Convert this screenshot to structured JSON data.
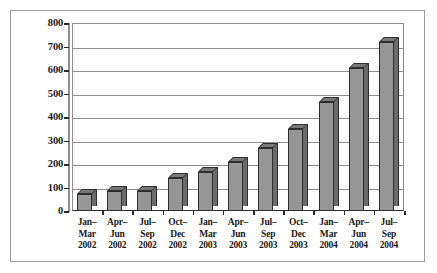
{
  "chart_data": {
    "type": "bar",
    "title": "",
    "subtitle": "",
    "xlabel": "",
    "ylabel": "",
    "ylim": [
      0,
      800
    ],
    "ytick_step": 100,
    "yticks": [
      800,
      700,
      600,
      500,
      400,
      300,
      200,
      100,
      0
    ],
    "ytick_labels": [
      "800",
      "700",
      "600",
      "500",
      "400",
      "300",
      "200",
      "100",
      "0"
    ],
    "grid": true,
    "grid_axis": "y",
    "legend": false,
    "legend_position": "none",
    "style": "3d-bar",
    "bar_color": "#969696",
    "bar_side_color": "#6b6b6b",
    "bar_top_color": "#787878",
    "bar_edge_color": "#2e2e2e",
    "grid_color": "#8d8d8d",
    "axis_color": "#2b2b2b",
    "frame_color": "#9a9a9a",
    "background_color": "#ffffff",
    "categories": [
      "Jan–Mar 2002",
      "Apr–Jun 2002",
      "Jul–Sep 2002",
      "Oct–Dec 2002",
      "Jan–Mar 2003",
      "Apr–Jun 2003",
      "Jul–Sep 2003",
      "Oct–Dec 2003",
      "Jan–Mar 2004",
      "Apr–Jun 2004",
      "Jul–Sep 2004"
    ],
    "category_lines": [
      [
        "Jan–",
        "Mar",
        "2002"
      ],
      [
        "Apr–",
        "Jun",
        "2002"
      ],
      [
        "Jul–",
        "Sep",
        "2002"
      ],
      [
        "Oct–",
        "Dec",
        "2002"
      ],
      [
        "Jan–",
        "Mar",
        "2003"
      ],
      [
        "Apr–",
        "Jun",
        "2003"
      ],
      [
        "Jul–",
        "Sep",
        "2003"
      ],
      [
        "Oct–",
        "Dec",
        "2003"
      ],
      [
        "Jan–",
        "Mar",
        "2004"
      ],
      [
        "Apr–",
        "Jun",
        "2004"
      ],
      [
        "Jul–",
        "Sep",
        "2004"
      ]
    ],
    "values": [
      72,
      85,
      85,
      140,
      165,
      210,
      270,
      350,
      465,
      610,
      720
    ]
  }
}
